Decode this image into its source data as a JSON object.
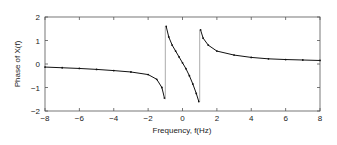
{
  "chart_data": {
    "type": "scatter",
    "title": "",
    "xlabel": "Frequency, f(Hz)",
    "ylabel": "Phase of X(f)",
    "xlim": [
      -8,
      8
    ],
    "ylim": [
      -2,
      2
    ],
    "xticks": [
      -8,
      -6,
      -4,
      -2,
      0,
      2,
      4,
      6,
      8
    ],
    "yticks": [
      -2,
      -1,
      0,
      1,
      2
    ],
    "grid": false,
    "legend": null,
    "values_note": "Points estimated by reading pixels against the axis scale; not derived from a known formula.",
    "series": [
      {
        "name": "phase",
        "style": "dots-with-line",
        "color": "#111111",
        "segments": [
          {
            "x": [
              -8,
              -7,
              -6,
              -5,
              -4,
              -3,
              -2,
              -1.5,
              -1.2,
              -1.05
            ],
            "y": [
              -0.13,
              -0.16,
              -0.19,
              -0.23,
              -0.28,
              -0.34,
              -0.45,
              -0.65,
              -1.0,
              -1.45
            ]
          },
          {
            "x": [
              -0.95,
              -0.8,
              -0.6,
              -0.4,
              -0.2,
              0,
              0.2,
              0.4,
              0.6,
              0.8,
              0.95
            ],
            "y": [
              1.6,
              1.15,
              0.8,
              0.55,
              0.3,
              0.05,
              -0.2,
              -0.5,
              -0.85,
              -1.25,
              -1.6
            ]
          },
          {
            "x": [
              1.05,
              1.2,
              1.5,
              2,
              3,
              4,
              5,
              6,
              7,
              8
            ],
            "y": [
              1.45,
              1.1,
              0.8,
              0.55,
              0.38,
              0.28,
              0.22,
              0.19,
              0.17,
              0.15
            ]
          }
        ],
        "jumps": [
          {
            "x": -1,
            "from": -1.5,
            "to": 1.6
          },
          {
            "x": 1,
            "from": -1.6,
            "to": 1.45
          }
        ]
      }
    ]
  }
}
